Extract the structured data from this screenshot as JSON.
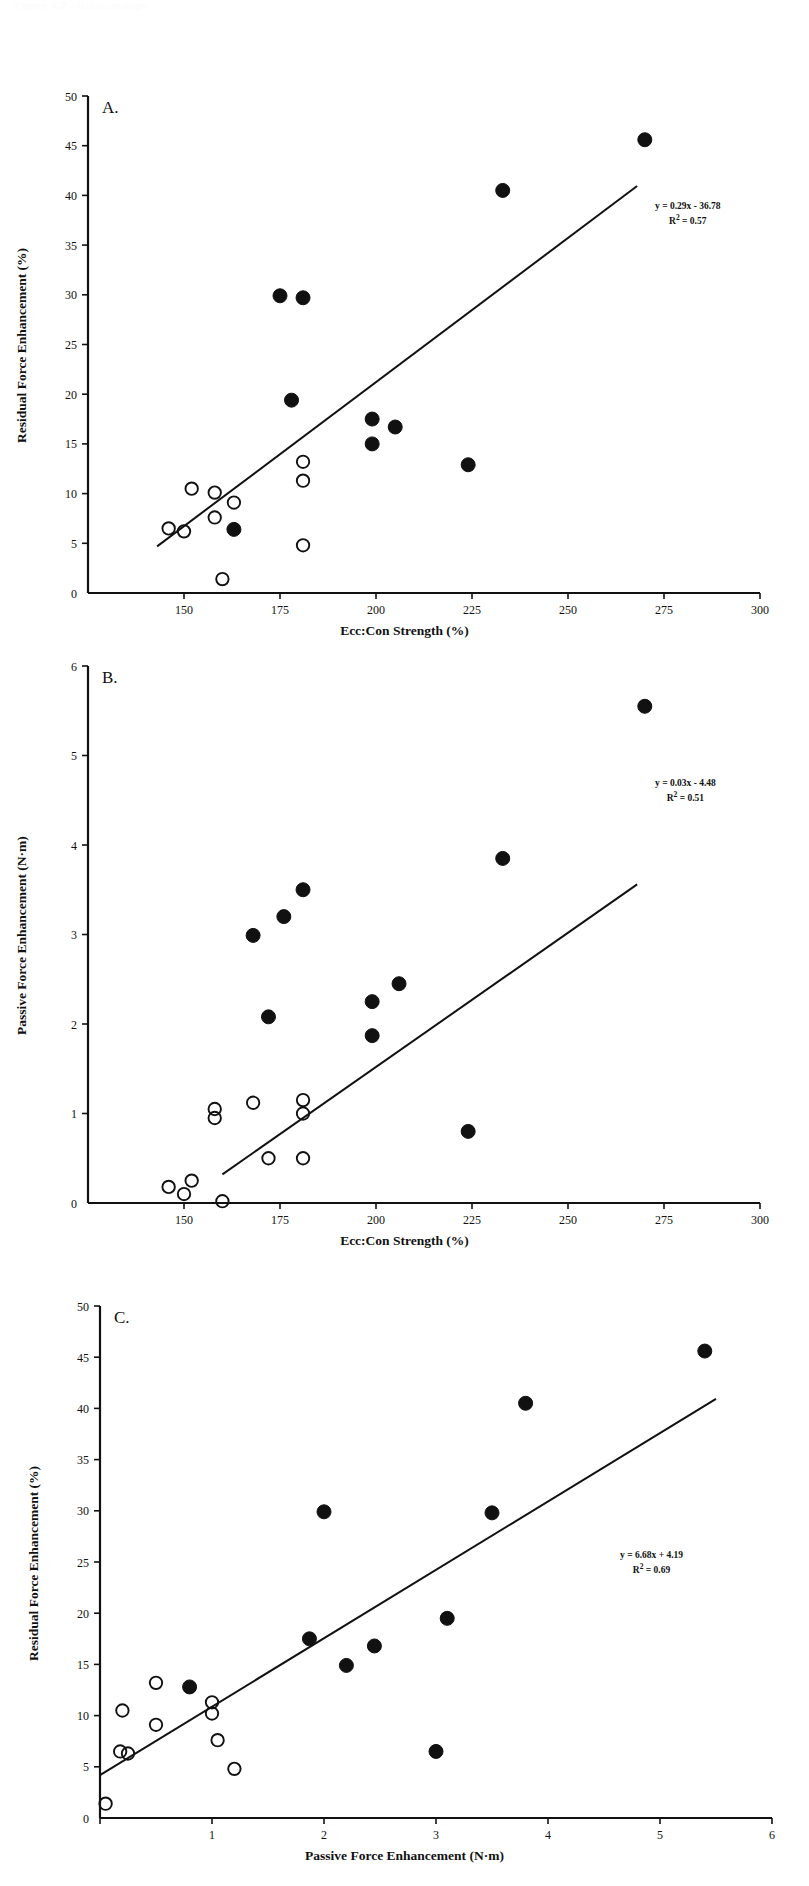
{
  "page": {
    "faint_header": "Figure 4.2 - Relationships",
    "background": "#ffffff",
    "ink": "#111111"
  },
  "panels": [
    {
      "id": "A",
      "letter": "A.",
      "equation": "y = 0.29x - 36.78",
      "r2_prefix": "R",
      "r2_sup": "2",
      "r2_value": " = 0.57"
    },
    {
      "id": "B",
      "letter": "B.",
      "equation": "y = 0.03x - 4.48",
      "r2_prefix": "R",
      "r2_sup": "2",
      "r2_value": " = 0.51"
    },
    {
      "id": "C",
      "letter": "C.",
      "equation": "y = 6.68x + 4.19",
      "r2_prefix": "R",
      "r2_sup": "2",
      "r2_value": " = 0.69"
    }
  ],
  "chart_data": [
    {
      "type": "scatter",
      "panel": "A",
      "title": "",
      "xlabel": "Ecc:Con Strength (%)",
      "ylabel": "Residual Force Enhancement (%)",
      "xlim": [
        125,
        300
      ],
      "ylim": [
        0,
        50
      ],
      "xticks": [
        150,
        175,
        200,
        225,
        250,
        275,
        300
      ],
      "yticks": [
        0,
        5,
        10,
        15,
        20,
        25,
        30,
        35,
        40,
        45,
        50
      ],
      "grid": false,
      "legend": null,
      "annotation": "y = 0.29x - 36.78\nR² = 0.57",
      "trendline": {
        "slope": 0.29,
        "intercept": -36.78,
        "r2": 0.57,
        "x_start": 143,
        "x_end": 268
      },
      "series": [
        {
          "name": "filled",
          "marker": "filled-circle",
          "points": [
            [
              175,
              29.9
            ],
            [
              181,
              29.7
            ],
            [
              178,
              19.4
            ],
            [
              163,
              6.4
            ],
            [
              199,
              17.5
            ],
            [
              199,
              15.0
            ],
            [
              205,
              16.7
            ],
            [
              224,
              12.9
            ],
            [
              233,
              40.5
            ],
            [
              270,
              45.6
            ]
          ]
        },
        {
          "name": "open",
          "marker": "open-circle",
          "points": [
            [
              146,
              6.5
            ],
            [
              150,
              6.2
            ],
            [
              152,
              10.5
            ],
            [
              158,
              10.1
            ],
            [
              163,
              9.1
            ],
            [
              158,
              7.6
            ],
            [
              181,
              13.2
            ],
            [
              181,
              11.3
            ],
            [
              181,
              4.8
            ],
            [
              160,
              1.4
            ]
          ]
        }
      ]
    },
    {
      "type": "scatter",
      "panel": "B",
      "title": "",
      "xlabel": "Ecc:Con Strength (%)",
      "ylabel": "Passive Force Enhancement (N·m)",
      "xlim": [
        125,
        300
      ],
      "ylim": [
        0,
        6
      ],
      "xticks": [
        150,
        175,
        200,
        225,
        250,
        275,
        300
      ],
      "yticks": [
        0,
        1,
        2,
        3,
        4,
        5,
        6
      ],
      "grid": false,
      "legend": null,
      "annotation": "y = 0.03x - 4.48\nR² = 0.51",
      "trendline": {
        "slope": 0.03,
        "intercept": -4.48,
        "r2": 0.51,
        "x_start": 160,
        "x_end": 268
      },
      "series": [
        {
          "name": "filled",
          "marker": "filled-circle",
          "points": [
            [
              168,
              2.99
            ],
            [
              172,
              2.08
            ],
            [
              176,
              3.2
            ],
            [
              181,
              3.5
            ],
            [
              199,
              2.25
            ],
            [
              199,
              1.87
            ],
            [
              206,
              2.45
            ],
            [
              224,
              0.8
            ],
            [
              233,
              3.85
            ],
            [
              270,
              5.55
            ]
          ]
        },
        {
          "name": "open",
          "marker": "open-circle",
          "points": [
            [
              146,
              0.18
            ],
            [
              150,
              0.1
            ],
            [
              152,
              0.25
            ],
            [
              158,
              1.05
            ],
            [
              158,
              0.95
            ],
            [
              160,
              0.02
            ],
            [
              168,
              1.12
            ],
            [
              172,
              0.5
            ],
            [
              181,
              1.15
            ],
            [
              181,
              1.0
            ],
            [
              181,
              0.5
            ]
          ]
        }
      ]
    },
    {
      "type": "scatter",
      "panel": "C",
      "title": "",
      "xlabel": "Passive Force Enhancement (N·m)",
      "ylabel": "Residual Force Enhancement (%)",
      "xlim": [
        0,
        6
      ],
      "ylim": [
        0,
        50
      ],
      "xticks": [
        0,
        1,
        2,
        3,
        4,
        5,
        6
      ],
      "yticks": [
        0,
        5,
        10,
        15,
        20,
        25,
        30,
        35,
        40,
        45,
        50
      ],
      "grid": false,
      "legend": null,
      "annotation": "y = 6.68x + 4.19\nR² = 0.69",
      "trendline": {
        "slope": 6.68,
        "intercept": 4.19,
        "r2": 0.69,
        "x_start": 0.0,
        "x_end": 5.5
      },
      "series": [
        {
          "name": "filled",
          "marker": "filled-circle",
          "points": [
            [
              0.8,
              12.8
            ],
            [
              1.87,
              17.5
            ],
            [
              2.0,
              29.9
            ],
            [
              2.2,
              14.9
            ],
            [
              2.45,
              16.8
            ],
            [
              3.0,
              6.5
            ],
            [
              3.1,
              19.5
            ],
            [
              3.5,
              29.8
            ],
            [
              3.8,
              40.5
            ],
            [
              5.4,
              45.6
            ]
          ]
        },
        {
          "name": "open",
          "marker": "open-circle",
          "points": [
            [
              0.05,
              1.4
            ],
            [
              0.18,
              6.5
            ],
            [
              0.25,
              6.3
            ],
            [
              0.2,
              10.5
            ],
            [
              0.5,
              13.2
            ],
            [
              0.5,
              9.1
            ],
            [
              1.0,
              11.3
            ],
            [
              1.0,
              10.2
            ],
            [
              1.05,
              7.6
            ],
            [
              1.2,
              4.8
            ]
          ]
        }
      ]
    }
  ]
}
